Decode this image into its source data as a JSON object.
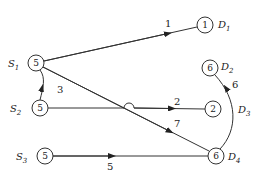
{
  "diagram": {
    "type": "flow-network",
    "nodes": [
      {
        "id": "S1",
        "label": "S",
        "sub": "1",
        "value": "5",
        "x": 36,
        "y": 63
      },
      {
        "id": "S2",
        "label": "S",
        "sub": "2",
        "value": "5",
        "x": 40,
        "y": 108
      },
      {
        "id": "S3",
        "label": "S",
        "sub": "3",
        "value": "5",
        "x": 45,
        "y": 156
      },
      {
        "id": "D1",
        "label": "D",
        "sub": "1",
        "value": "1",
        "x": 205,
        "y": 25
      },
      {
        "id": "D2",
        "label": "D",
        "sub": "2",
        "value": "6",
        "x": 210,
        "y": 68
      },
      {
        "id": "D3node",
        "label": "",
        "sub": "",
        "value": "2",
        "x": 213,
        "y": 109
      },
      {
        "id": "D4",
        "label": "D",
        "sub": "4",
        "value": "6",
        "x": 216,
        "y": 156
      }
    ],
    "edge_labels": {
      "s1_d1": "1",
      "s2_s1": "3",
      "s2_n2": "2",
      "s1_d4": "7",
      "s3_d4": "5",
      "d4_d2": "6"
    },
    "extra_labels": {
      "D3": {
        "label": "D",
        "sub": "3"
      }
    }
  }
}
